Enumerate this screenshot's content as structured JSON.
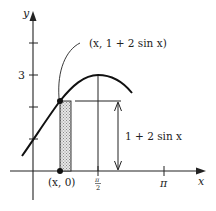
{
  "diagram": {
    "axes": {
      "x_label": "x",
      "y_label": "y",
      "y_tick_label_3": "3",
      "x_tick_label_pi_half_num": "π",
      "x_tick_label_pi_half_den": "2",
      "x_tick_label_pi": "π"
    },
    "curve": {
      "function": "1 + 2 sin x",
      "point_label": "(x, 1 + 2 sin x)"
    },
    "base_point_label": "(x, 0)",
    "height_label": "1 + 2 sin x",
    "colors": {
      "ink": "#222222",
      "strip_fill": "#cfcfcf",
      "background": "#ffffff"
    }
  }
}
